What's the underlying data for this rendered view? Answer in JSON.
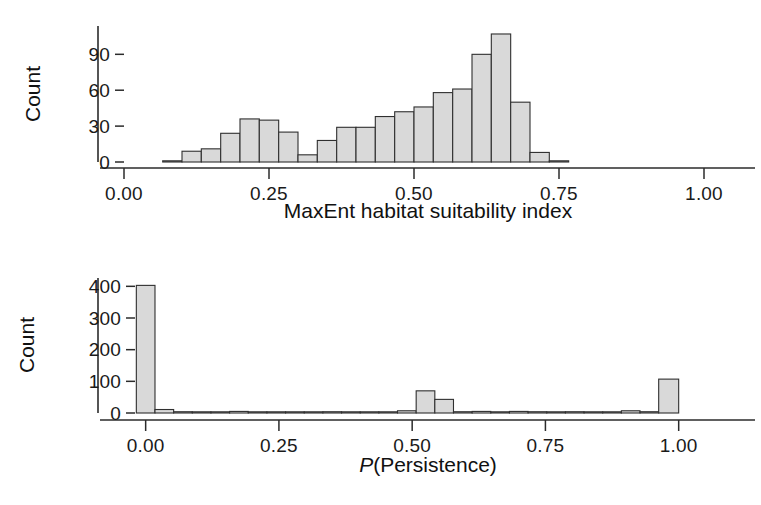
{
  "figure": {
    "background": "#ffffff",
    "bar_fill": "#d9d9d9",
    "bar_stroke": "#2f2f2f",
    "axis_color": "#2b2b2b"
  },
  "chart_data": [
    {
      "type": "bar",
      "subplot": "top",
      "title": "",
      "xlabel": "MaxEnt habitat suitability index",
      "ylabel": "Count",
      "xlim": [
        0.0,
        1.0
      ],
      "ylim": [
        0,
        112
      ],
      "xticks": [
        0.0,
        0.25,
        0.5,
        0.75,
        1.0
      ],
      "xticklabels": [
        "0.00",
        "0.25",
        "0.50",
        "0.75",
        "1.00"
      ],
      "yticks": [
        0,
        30,
        60,
        90
      ],
      "yticklabels": [
        "0",
        "30",
        "60",
        "90"
      ],
      "grid": false,
      "legend": null,
      "bin_width": 0.0333,
      "bin_edges": [
        0.0667,
        0.1,
        0.1333,
        0.1667,
        0.2,
        0.2333,
        0.2667,
        0.3,
        0.3333,
        0.3667,
        0.4,
        0.4333,
        0.4667,
        0.5,
        0.5333,
        0.5667,
        0.6,
        0.6333,
        0.6667,
        0.7,
        0.7333,
        0.7667
      ],
      "values": [
        1,
        9,
        11,
        24,
        36,
        35,
        25,
        6,
        18,
        29,
        29,
        38,
        42,
        46,
        58,
        61,
        90,
        107,
        50,
        8,
        1
      ]
    },
    {
      "type": "bar",
      "subplot": "bottom",
      "title": "",
      "xlabel": "P(Persistence)",
      "xlabel_italic_prefix": "P",
      "xlabel_rest": "(Persistence)",
      "ylabel": "Count",
      "xlim": [
        -0.02,
        1.04
      ],
      "ylim": [
        0,
        420
      ],
      "xticks": [
        0.0,
        0.25,
        0.5,
        0.75,
        1.0
      ],
      "xticklabels": [
        "0.00",
        "0.25",
        "0.50",
        "0.75",
        "1.00"
      ],
      "yticks": [
        0,
        100,
        200,
        300,
        400
      ],
      "yticklabels": [
        "0",
        "100",
        "200",
        "300",
        "400"
      ],
      "grid": false,
      "legend": null,
      "bin_width": 0.035,
      "bin_edges": [
        -0.0175,
        0.0175,
        0.0525,
        0.0875,
        0.1225,
        0.1575,
        0.1925,
        0.2275,
        0.2625,
        0.2975,
        0.3325,
        0.3675,
        0.4025,
        0.4375,
        0.4725,
        0.5075,
        0.5425,
        0.5775,
        0.6125,
        0.6475,
        0.6825,
        0.7175,
        0.7525,
        0.7875,
        0.8225,
        0.8575,
        0.8925,
        0.9275,
        0.9625,
        1.0
      ],
      "values": [
        403,
        11,
        4,
        2,
        3,
        5,
        2,
        2,
        1,
        3,
        4,
        1,
        2,
        3,
        7,
        70,
        43,
        4,
        5,
        3,
        5,
        4,
        2,
        4,
        3,
        2,
        7,
        4,
        107
      ]
    }
  ]
}
